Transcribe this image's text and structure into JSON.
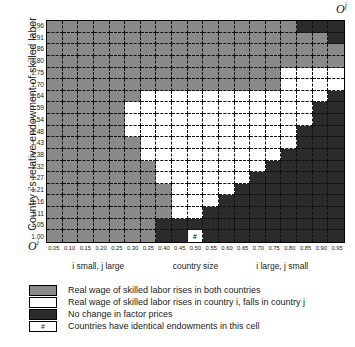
{
  "figure": {
    "origin_top_right": "O",
    "origin_top_right_sup": "j",
    "origin_bottom_left": "O",
    "origin_bottom_left_sup": "i",
    "y_axis_title": "Country i's relative endowment of skilled labor"
  },
  "chart_data": {
    "type": "heatmap",
    "title": "",
    "xlabel": "country size",
    "ylabel": "Country i's relative endowment of skilled labor",
    "grid": true,
    "legend_position": "bottom-left",
    "xlim": [
      0.0,
      1.0
    ],
    "ylim": [
      1.0,
      1.96
    ],
    "x_tick_labels": [
      "0.05",
      "0.10",
      "0.15",
      "0.20",
      "0.25",
      "0.30",
      "0.35",
      "0.40",
      "0.45",
      "0.50",
      "0.55",
      "0.60",
      "0.65",
      "0.70",
      "0.75",
      "0.80",
      "0.85",
      "0.90",
      "0.95"
    ],
    "y_tick_labels": [
      "1.96",
      "1.91",
      "1.86",
      "1.80",
      "1.75",
      "1.70",
      "1.64",
      "1.59",
      "1.54",
      "1.48",
      "1.43",
      "1.38",
      "1.32",
      "1.27",
      "1.21",
      "1.16",
      "1.11",
      "1.05",
      "1.00"
    ],
    "x_sublabels": [
      {
        "text": "i small,  j large",
        "x": 0.175
      },
      {
        "text": "country size",
        "x": 0.5
      },
      {
        "text": "i large,  j small",
        "x": 0.79
      }
    ],
    "categories_meaning": {
      "g": "Real wage of skilled labor rises in both countries",
      "w": "Real wage of skilled labor rises in country i, falls in country j",
      "d": "No change in factor prices",
      "h": "Countries have identical endowments in this cell"
    },
    "cells": [
      [
        "g",
        "g",
        "g",
        "g",
        "g",
        "g",
        "g",
        "g",
        "g",
        "g",
        "g",
        "g",
        "g",
        "g",
        "g",
        "g",
        "d",
        "d",
        "d"
      ],
      [
        "g",
        "g",
        "g",
        "g",
        "g",
        "g",
        "g",
        "g",
        "g",
        "g",
        "g",
        "g",
        "g",
        "g",
        "g",
        "g",
        "g",
        "g",
        "d"
      ],
      [
        "g",
        "g",
        "g",
        "g",
        "g",
        "g",
        "g",
        "g",
        "g",
        "g",
        "g",
        "g",
        "g",
        "g",
        "g",
        "g",
        "g",
        "g",
        "g"
      ],
      [
        "g",
        "g",
        "g",
        "g",
        "g",
        "g",
        "g",
        "g",
        "g",
        "g",
        "g",
        "g",
        "g",
        "g",
        "g",
        "g",
        "g",
        "g",
        "g"
      ],
      [
        "g",
        "g",
        "g",
        "g",
        "g",
        "g",
        "g",
        "g",
        "g",
        "g",
        "g",
        "g",
        "g",
        "g",
        "g",
        "w",
        "w",
        "w",
        "w"
      ],
      [
        "g",
        "g",
        "g",
        "g",
        "g",
        "g",
        "g",
        "g",
        "g",
        "g",
        "g",
        "g",
        "g",
        "g",
        "g",
        "w",
        "w",
        "w",
        "w"
      ],
      [
        "g",
        "g",
        "g",
        "g",
        "g",
        "g",
        "w",
        "w",
        "w",
        "w",
        "w",
        "w",
        "w",
        "w",
        "w",
        "w",
        "w",
        "w",
        "d"
      ],
      [
        "g",
        "g",
        "g",
        "g",
        "g",
        "w",
        "w",
        "w",
        "w",
        "w",
        "w",
        "w",
        "w",
        "w",
        "w",
        "w",
        "w",
        "d",
        "d"
      ],
      [
        "g",
        "g",
        "g",
        "g",
        "g",
        "w",
        "w",
        "w",
        "w",
        "w",
        "w",
        "w",
        "w",
        "w",
        "w",
        "w",
        "w",
        "d",
        "d"
      ],
      [
        "g",
        "g",
        "g",
        "g",
        "g",
        "w",
        "w",
        "w",
        "w",
        "w",
        "w",
        "w",
        "w",
        "w",
        "w",
        "w",
        "d",
        "d",
        "d"
      ],
      [
        "g",
        "g",
        "g",
        "g",
        "g",
        "g",
        "w",
        "w",
        "w",
        "w",
        "w",
        "w",
        "w",
        "w",
        "w",
        "w",
        "d",
        "d",
        "d"
      ],
      [
        "g",
        "g",
        "g",
        "g",
        "g",
        "g",
        "w",
        "w",
        "w",
        "w",
        "w",
        "w",
        "w",
        "w",
        "w",
        "d",
        "d",
        "d",
        "d"
      ],
      [
        "g",
        "g",
        "g",
        "g",
        "g",
        "g",
        "g",
        "w",
        "w",
        "w",
        "w",
        "w",
        "w",
        "w",
        "d",
        "d",
        "d",
        "d",
        "d"
      ],
      [
        "g",
        "g",
        "g",
        "g",
        "g",
        "g",
        "g",
        "w",
        "w",
        "w",
        "w",
        "w",
        "w",
        "d",
        "d",
        "d",
        "d",
        "d",
        "d"
      ],
      [
        "g",
        "g",
        "g",
        "g",
        "g",
        "g",
        "g",
        "g",
        "w",
        "w",
        "w",
        "w",
        "d",
        "d",
        "d",
        "d",
        "d",
        "d",
        "d"
      ],
      [
        "g",
        "g",
        "g",
        "g",
        "g",
        "g",
        "g",
        "g",
        "w",
        "w",
        "w",
        "d",
        "d",
        "d",
        "d",
        "d",
        "d",
        "d",
        "d"
      ],
      [
        "g",
        "g",
        "g",
        "g",
        "g",
        "g",
        "g",
        "g",
        "w",
        "w",
        "d",
        "d",
        "d",
        "d",
        "d",
        "d",
        "d",
        "d",
        "d"
      ],
      [
        "g",
        "g",
        "g",
        "g",
        "g",
        "g",
        "g",
        "d",
        "d",
        "d",
        "d",
        "d",
        "d",
        "d",
        "d",
        "d",
        "d",
        "d",
        "d"
      ],
      [
        "g",
        "g",
        "g",
        "g",
        "g",
        "g",
        "g",
        "d",
        "d",
        "h",
        "d",
        "d",
        "d",
        "d",
        "d",
        "d",
        "d",
        "d",
        "d"
      ]
    ],
    "hash_symbol": "#"
  },
  "legend": {
    "items": [
      {
        "swatch": "g",
        "label": "Real wage of skilled labor rises in both countries"
      },
      {
        "swatch": "w",
        "label": "Real wage of skilled labor rises in country i, falls in country j"
      },
      {
        "swatch": "d",
        "label": "No change in factor prices"
      },
      {
        "swatch": "h",
        "label": "Countries have identical endowments in this cell",
        "symbol": "#"
      }
    ]
  },
  "colors": {
    "gray": "#8a8a8a",
    "white": "#ffffff",
    "dark": "#2b2b2b",
    "axis": "#000000"
  }
}
